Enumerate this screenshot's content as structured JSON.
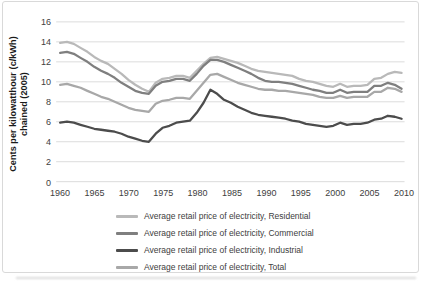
{
  "chart_data": {
    "type": "line",
    "title": "",
    "ylabel_line1": "Cents per kilowatthour (c/kWh)",
    "ylabel_line2": "chained (2005)",
    "xlabel": "",
    "xlim": [
      1960,
      2010
    ],
    "ylim": [
      0,
      16
    ],
    "x_ticks": [
      1960,
      1965,
      1970,
      1975,
      1980,
      1985,
      1990,
      1995,
      2000,
      2005,
      2010
    ],
    "y_ticks": [
      0,
      2,
      4,
      6,
      8,
      10,
      12,
      14,
      16
    ],
    "grid": "horizontal-only",
    "legend_position": "bottom-center",
    "x": [
      1960,
      1961,
      1962,
      1963,
      1964,
      1965,
      1966,
      1967,
      1968,
      1969,
      1970,
      1971,
      1972,
      1973,
      1974,
      1975,
      1976,
      1977,
      1978,
      1979,
      1980,
      1981,
      1982,
      1983,
      1984,
      1985,
      1986,
      1987,
      1988,
      1989,
      1990,
      1991,
      1992,
      1993,
      1994,
      1995,
      1996,
      1997,
      1998,
      1999,
      2000,
      2001,
      2002,
      2003,
      2004,
      2005,
      2006,
      2007,
      2008,
      2009,
      2010
    ],
    "series": [
      {
        "name": "Average retail price of electricity, Residential",
        "color": "#b9b9b9",
        "values": [
          13.9,
          14.0,
          13.8,
          13.4,
          13.0,
          12.5,
          12.1,
          11.8,
          11.3,
          10.8,
          10.2,
          9.7,
          9.3,
          9.0,
          9.9,
          10.3,
          10.4,
          10.6,
          10.6,
          10.4,
          11.1,
          11.8,
          12.4,
          12.5,
          12.3,
          12.1,
          11.9,
          11.6,
          11.3,
          11.1,
          11.0,
          10.9,
          10.8,
          10.7,
          10.6,
          10.3,
          10.1,
          10.0,
          9.8,
          9.6,
          9.5,
          9.8,
          9.5,
          9.6,
          9.6,
          9.7,
          10.3,
          10.4,
          10.8,
          11.0,
          10.9
        ]
      },
      {
        "name": "Average retail price of electricity, Commercial",
        "color": "#7f7f7f",
        "values": [
          12.9,
          13.0,
          12.8,
          12.4,
          12.0,
          11.5,
          11.1,
          10.8,
          10.4,
          9.9,
          9.5,
          9.1,
          8.9,
          8.8,
          9.6,
          10.0,
          10.1,
          10.3,
          10.3,
          10.1,
          10.8,
          11.6,
          12.2,
          12.2,
          12.0,
          11.7,
          11.4,
          11.1,
          10.8,
          10.4,
          10.1,
          10.0,
          10.0,
          9.9,
          9.8,
          9.6,
          9.4,
          9.2,
          9.1,
          8.9,
          8.9,
          9.2,
          8.9,
          9.0,
          9.0,
          9.0,
          9.6,
          9.6,
          9.9,
          9.7,
          9.3
        ]
      },
      {
        "name": "Average retail price of electricity, Industrial",
        "color": "#4c4c4c",
        "values": [
          5.9,
          6.0,
          5.9,
          5.7,
          5.5,
          5.3,
          5.2,
          5.1,
          5.0,
          4.8,
          4.5,
          4.3,
          4.1,
          4.0,
          4.8,
          5.4,
          5.6,
          5.9,
          6.0,
          6.1,
          6.9,
          7.9,
          9.2,
          8.8,
          8.2,
          7.9,
          7.5,
          7.2,
          6.9,
          6.7,
          6.6,
          6.5,
          6.4,
          6.3,
          6.1,
          6.0,
          5.8,
          5.7,
          5.6,
          5.5,
          5.6,
          5.9,
          5.7,
          5.8,
          5.8,
          5.9,
          6.2,
          6.3,
          6.6,
          6.5,
          6.3
        ]
      },
      {
        "name": "Average retail price of electricity, Total",
        "color": "#a8a8a8",
        "values": [
          9.7,
          9.8,
          9.6,
          9.4,
          9.1,
          8.8,
          8.5,
          8.3,
          8.0,
          7.7,
          7.4,
          7.2,
          7.1,
          7.0,
          7.8,
          8.1,
          8.2,
          8.4,
          8.4,
          8.3,
          9.1,
          9.9,
          10.7,
          10.8,
          10.5,
          10.2,
          9.9,
          9.7,
          9.5,
          9.3,
          9.2,
          9.2,
          9.1,
          9.1,
          9.0,
          8.9,
          8.8,
          8.7,
          8.5,
          8.4,
          8.4,
          8.6,
          8.4,
          8.5,
          8.5,
          8.5,
          9.0,
          9.0,
          9.4,
          9.3,
          9.0
        ]
      }
    ]
  },
  "colors": {
    "background": "#ffffff",
    "frame_border": "#d9d9d9",
    "gridline": "#dcdcdc",
    "tick_text": "#404040",
    "legend_text": "#404040",
    "axis_title_text": "#1a1a1a"
  }
}
